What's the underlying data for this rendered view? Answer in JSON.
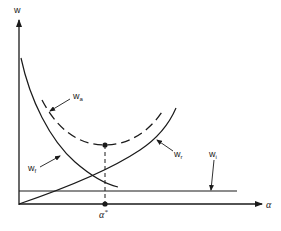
{
  "diagram": {
    "type": "cost-curve-diagram",
    "axes": {
      "y_label": "w",
      "x_label": "α"
    },
    "curves": [
      {
        "id": "w_a",
        "label_main": "w",
        "label_sub": "a",
        "style": "dashed",
        "shape": "U-shaped total"
      },
      {
        "id": "w_f",
        "label_main": "w",
        "label_sub": "f",
        "style": "solid",
        "shape": "decreasing"
      },
      {
        "id": "w_r",
        "label_main": "w",
        "label_sub": "r",
        "style": "solid",
        "shape": "increasing"
      },
      {
        "id": "w_i",
        "label_main": "w",
        "label_sub": "i",
        "style": "solid",
        "shape": "horizontal constant"
      }
    ],
    "optimum": {
      "label_main": "α",
      "label_sup": "*",
      "description": "minimum of w_a curve projected onto α axis"
    },
    "colors": {
      "ink": "#1a1a1a",
      "background": "#ffffff"
    }
  }
}
